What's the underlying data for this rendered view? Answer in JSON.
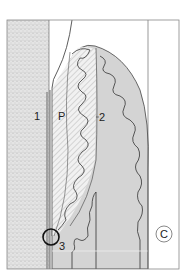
{
  "figure": {
    "labels": {
      "l1": "1",
      "lP": "P",
      "l2": "2",
      "l3": "3",
      "lC": "C"
    },
    "regions": [
      {
        "id": "1",
        "description": "stippled bone/tooth layer on left"
      },
      {
        "id": "P",
        "description": "hatched region"
      },
      {
        "id": "2",
        "description": "grey lobular tissue"
      },
      {
        "id": "3",
        "description": "circled junction point"
      },
      {
        "id": "C",
        "description": "circled corner label"
      }
    ],
    "colors": {
      "stipple": "#dcdcdc",
      "tissue": "#d4d4d4",
      "tissue_light": "#e2e2e2",
      "line": "#333333",
      "frame": "#888888"
    }
  }
}
